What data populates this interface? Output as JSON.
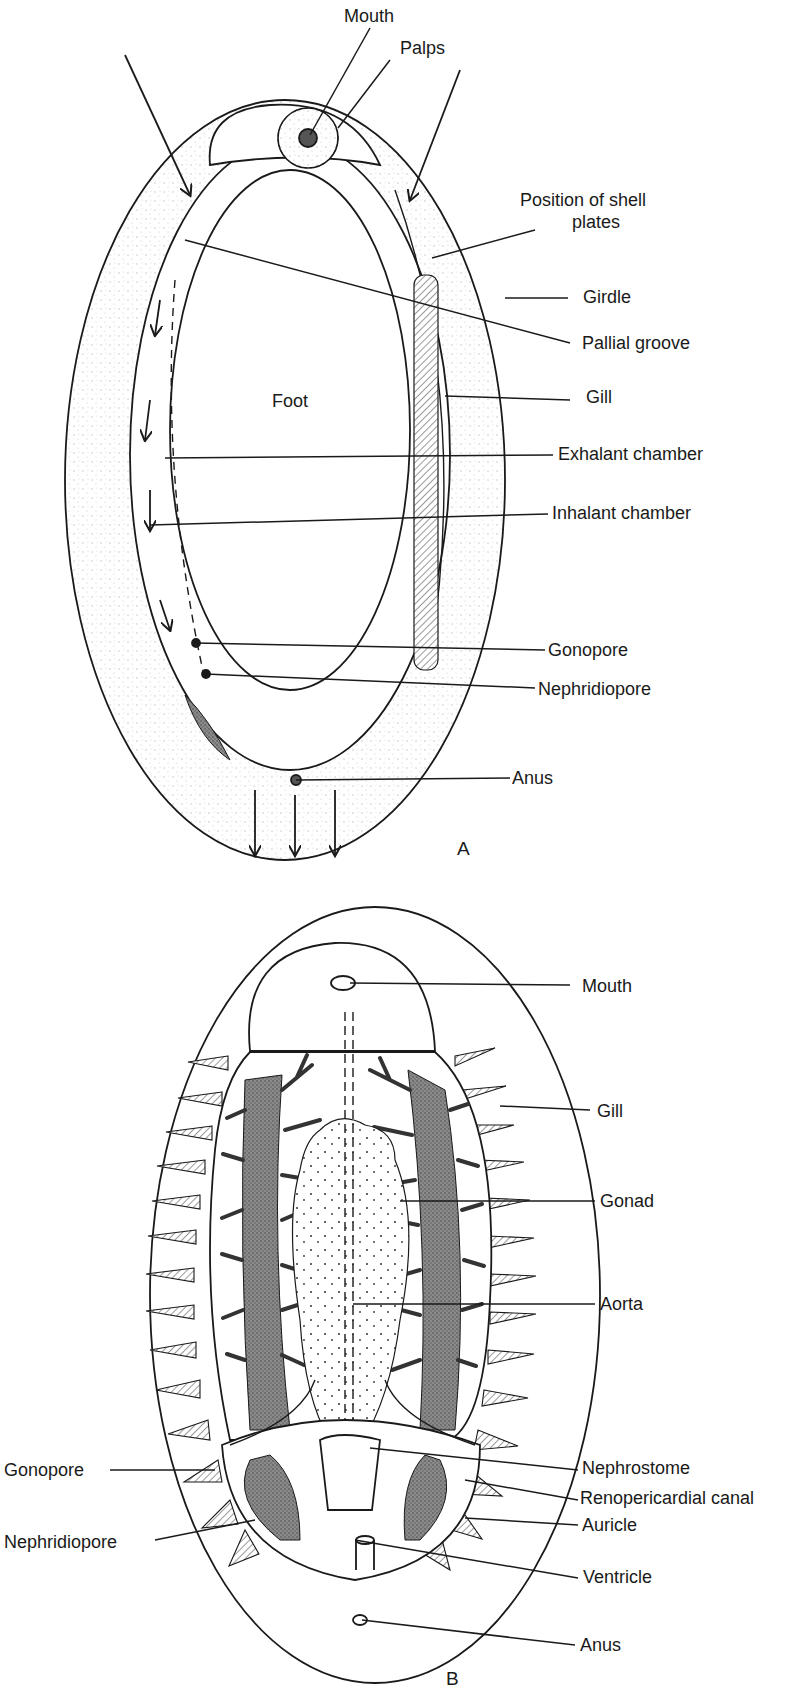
{
  "figure": {
    "panel_a": {
      "letter": "A",
      "labels": {
        "mouth": "Mouth",
        "palps": "Palps",
        "position_of_shell_line1": "Position of shell",
        "position_of_shell_line2": "plates",
        "girdle": "Girdle",
        "pallial_groove": "Pallial groove",
        "foot": "Foot",
        "gill": "Gill",
        "exhalant_chamber": "Exhalant chamber",
        "inhalant_chamber": "Inhalant chamber",
        "gonopore": "Gonopore",
        "nephridiopore": "Nephridiopore",
        "anus": "Anus"
      }
    },
    "panel_b": {
      "letter": "B",
      "labels": {
        "mouth": "Mouth",
        "gill": "Gill",
        "gonad": "Gonad",
        "aorta": "Aorta",
        "gonopore": "Gonopore",
        "nephrostome": "Nephrostome",
        "renopericardial_canal": "Renopericardial canal",
        "nephridiopore": "Nephridiopore",
        "auricle": "Auricle",
        "ventricle": "Ventricle",
        "anus": "Anus"
      }
    },
    "colors": {
      "ink": "#1a1a1a",
      "stipple": "#d9d9d9",
      "dark_tissue": "#6e6e6e",
      "background": "#ffffff"
    }
  }
}
